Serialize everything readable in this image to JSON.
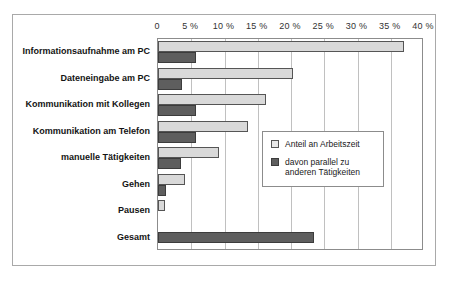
{
  "chart_data": {
    "type": "bar",
    "orientation": "horizontal",
    "title": "",
    "subtitle": "",
    "xlabel": "",
    "ylabel": "",
    "xlim": [
      0,
      40
    ],
    "grid": true,
    "legend_position": "inside-right",
    "tick_labels": [
      "0",
      "5 %",
      "10 %",
      "15 %",
      "20 %",
      "25 %",
      "30 %",
      "35 %",
      "40 %"
    ],
    "tick_values": [
      0,
      5,
      10,
      15,
      20,
      25,
      30,
      35,
      40
    ],
    "categories": [
      "Informationsaufnahme am PC",
      "Dateneingabe am PC",
      "Kommunikation mit Kollegen",
      "Kommunikation am Telefon",
      "manuelle Tätigkeiten",
      "Gehen",
      "Pausen",
      "Gesamt"
    ],
    "series": [
      {
        "name": "Anteil an Arbeitszeit",
        "color": "#d9d9d9",
        "values": [
          37,
          20.3,
          16.2,
          13.5,
          9.2,
          4,
          1,
          0
        ]
      },
      {
        "name": "davon parallel zu anderen Tätigkeiten",
        "color": "#5e5e5e",
        "values": [
          5.7,
          3.6,
          5.7,
          5.7,
          3.5,
          1.2,
          0,
          23.5
        ]
      }
    ]
  },
  "legend": {
    "entries": [
      {
        "label": "Anteil an Arbeitszeit",
        "swatch": "light"
      },
      {
        "label": "davon parallel zu\nanderen Tätigkeiten",
        "swatch": "dark"
      }
    ]
  },
  "colors": {
    "series_light": "#d9d9d9",
    "series_dark": "#5e5e5e",
    "gridline": "#c0c0c0",
    "frame": "#8c8c8c",
    "outer_frame": "#a9a9a9"
  }
}
